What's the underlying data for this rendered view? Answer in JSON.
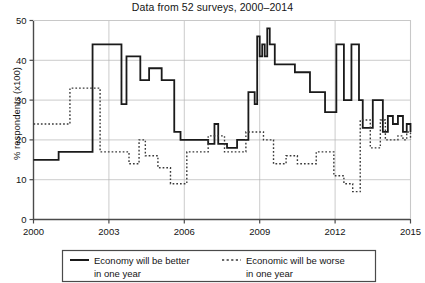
{
  "chart_data": {
    "type": "line",
    "title": "Data from 52 surveys, 2000–2014",
    "xlabel": "",
    "ylabel": "% respondents (x100)",
    "xlim": [
      2000,
      2015
    ],
    "ylim": [
      0,
      50
    ],
    "xticks": [
      "2000",
      "2003",
      "2006",
      "2009",
      "2012",
      "2015"
    ],
    "xtick_values": [
      2000,
      2003,
      2006,
      2009,
      2012,
      2015
    ],
    "yticks": [
      "0",
      "10",
      "20",
      "30",
      "40",
      "50"
    ],
    "ytick_values": [
      0,
      10,
      20,
      30,
      40,
      50
    ],
    "grid": true,
    "grid_color": "#b4b4b4",
    "legend_position": "below-axes",
    "series": [
      {
        "name": "Economy will be better\nin one year",
        "label_line1": "Economy will be better",
        "label_line2": "in one year",
        "style": "solid",
        "color": "#1a1a1a",
        "x": [
          2000.0,
          2000.55,
          2001.0,
          2001.35,
          2001.55,
          2002.0,
          2002.35,
          2002.5,
          2002.55,
          2003.0,
          2003.3,
          2003.45,
          2003.5,
          2003.62,
          2003.7,
          2003.85,
          2004.0,
          2004.25,
          2004.45,
          2004.6,
          2004.85,
          2005.1,
          2005.35,
          2005.6,
          2005.75,
          2005.85,
          2006.0,
          2006.2,
          2006.45,
          2006.7,
          2006.95,
          2007.1,
          2007.2,
          2007.35,
          2007.5,
          2007.7,
          2007.9,
          2008.1,
          2008.35,
          2008.55,
          2008.65,
          2008.8,
          2008.9,
          2009.0,
          2009.1,
          2009.2,
          2009.3,
          2009.4,
          2009.5,
          2009.6,
          2009.75,
          2009.9,
          2010.1,
          2010.4,
          2010.75,
          2011.0,
          2011.3,
          2011.6,
          2011.85,
          2012.05,
          2012.2,
          2012.35,
          2012.5,
          2012.65,
          2012.8,
          2012.95,
          2013.1,
          2013.3,
          2013.5,
          2013.7,
          2013.9,
          2014.1,
          2014.3,
          2014.5,
          2014.7,
          2014.85,
          2015.0
        ],
        "y": [
          15.0,
          15.0,
          17.0,
          17.0,
          17.0,
          17.0,
          44.0,
          44.0,
          44.0,
          44.0,
          44.0,
          44.0,
          29.0,
          29.0,
          41.0,
          41.0,
          41.0,
          35.0,
          35.0,
          38.0,
          38.0,
          35.0,
          35.0,
          22.0,
          22.0,
          20.0,
          20.0,
          20.0,
          20.0,
          20.0,
          19.0,
          19.0,
          24.0,
          19.0,
          19.0,
          18.0,
          18.0,
          20.0,
          20.0,
          32.0,
          32.0,
          29.0,
          46.0,
          41.0,
          44.0,
          41.0,
          48.0,
          44.0,
          44.0,
          39.0,
          39.0,
          39.0,
          39.0,
          37.0,
          37.0,
          32.0,
          32.0,
          27.0,
          27.0,
          44.0,
          44.0,
          30.0,
          30.0,
          44.0,
          44.0,
          30.0,
          23.0,
          23.0,
          30.0,
          30.0,
          22.0,
          26.0,
          24.0,
          26.0,
          22.0,
          24.0,
          22.0
        ]
      },
      {
        "name": "Economic will be worse\nin one year",
        "label_line1": "Economic will be worse",
        "label_line2": "in one year",
        "style": "dotted",
        "color": "#3a3a3a",
        "x": [
          2000.0,
          2000.6,
          2001.0,
          2001.45,
          2001.8,
          2002.1,
          2002.4,
          2002.55,
          2002.65,
          2003.0,
          2003.4,
          2003.6,
          2003.8,
          2004.0,
          2004.2,
          2004.45,
          2004.7,
          2004.95,
          2005.2,
          2005.45,
          2005.7,
          2005.9,
          2006.1,
          2006.3,
          2006.55,
          2006.75,
          2006.95,
          2007.15,
          2007.35,
          2007.6,
          2007.8,
          2008.0,
          2008.2,
          2008.45,
          2008.7,
          2008.95,
          2009.15,
          2009.35,
          2009.55,
          2009.8,
          2010.05,
          2010.3,
          2010.5,
          2010.75,
          2011.0,
          2011.25,
          2011.5,
          2011.75,
          2011.95,
          2012.15,
          2012.35,
          2012.55,
          2012.7,
          2012.85,
          2013.0,
          2013.2,
          2013.4,
          2013.6,
          2013.8,
          2014.0,
          2014.25,
          2014.5,
          2014.7,
          2014.85,
          2015.0
        ],
        "y": [
          24.0,
          24.0,
          24.0,
          33.0,
          33.0,
          33.0,
          33.0,
          33.0,
          17.0,
          17.0,
          17.0,
          17.0,
          14.0,
          14.0,
          20.0,
          16.0,
          16.0,
          13.0,
          13.0,
          9.0,
          9.0,
          9.0,
          17.0,
          17.0,
          17.0,
          17.0,
          21.0,
          21.0,
          21.0,
          17.0,
          17.0,
          17.0,
          17.0,
          22.0,
          22.0,
          22.0,
          20.0,
          20.0,
          14.0,
          14.0,
          16.0,
          16.0,
          14.0,
          14.0,
          14.0,
          17.0,
          17.0,
          17.0,
          11.0,
          11.0,
          9.0,
          9.0,
          7.0,
          7.0,
          25.0,
          25.0,
          18.0,
          18.0,
          25.0,
          20.0,
          20.0,
          21.0,
          20.0,
          22.0,
          20.0
        ]
      }
    ]
  },
  "legend": {
    "series1_label_line1": "Economy will be better",
    "series1_label_line2": "in one year",
    "series2_label_line1": "Economic will be worse",
    "series2_label_line2": "in one year"
  }
}
